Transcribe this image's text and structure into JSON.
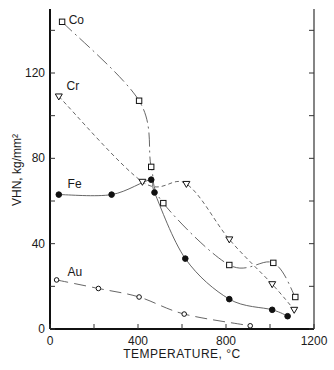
{
  "chart_data": {
    "type": "line",
    "title": "",
    "xlabel": "TEMPERATURE, °C",
    "ylabel": "VHN, kg/mm²",
    "xlim": [
      0,
      1200
    ],
    "ylim": [
      0,
      150
    ],
    "x_ticks": [
      0,
      400,
      800,
      1200
    ],
    "x_minor_ticks": [
      200,
      600,
      1000
    ],
    "y_ticks": [
      0,
      40,
      80,
      120
    ],
    "y_minor_ticks": [
      20,
      60,
      100,
      140
    ],
    "grid": false,
    "legend": "inline labels",
    "series": [
      {
        "name": "Co",
        "marker": "open-square",
        "line": "dash-dot",
        "label_pos": [
          85,
          143
        ],
        "points": [
          [
            55,
            144
          ],
          [
            405,
            107
          ],
          [
            460,
            76
          ],
          [
            515,
            59
          ],
          [
            815,
            30
          ],
          [
            1015,
            31
          ],
          [
            1115,
            15
          ]
        ]
      },
      {
        "name": "Cr",
        "marker": "open-triangle-down",
        "line": "dashed",
        "label_pos": [
          75,
          112
        ],
        "points": [
          [
            40,
            109
          ],
          [
            420,
            69
          ],
          [
            620,
            68
          ],
          [
            815,
            42
          ],
          [
            1010,
            21
          ],
          [
            1110,
            9
          ]
        ]
      },
      {
        "name": "Fe",
        "marker": "filled-circle",
        "line": "solid",
        "label_pos": [
          80,
          66
        ],
        "points": [
          [
            40,
            63
          ],
          [
            280,
            63
          ],
          [
            460,
            70
          ],
          [
            475,
            64
          ],
          [
            615,
            33
          ],
          [
            815,
            14
          ],
          [
            1010,
            9
          ],
          [
            1080,
            6
          ]
        ]
      },
      {
        "name": "Au",
        "marker": "open-circle",
        "line": "long-dash",
        "label_pos": [
          80,
          25
        ],
        "points": [
          [
            30,
            23
          ],
          [
            220,
            19
          ],
          [
            405,
            15
          ],
          [
            610,
            7
          ],
          [
            910,
            1.5
          ]
        ]
      }
    ]
  },
  "axes": {
    "x_label": "TEMPERATURE, °C",
    "y_label": "VHN, kg/mm²"
  }
}
